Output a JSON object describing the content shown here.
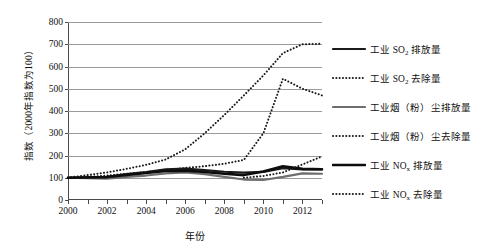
{
  "chart_data": {
    "type": "line",
    "title": "",
    "xlabel": "年份",
    "ylabel": "指数（2000年指数为100）",
    "x": [
      2000,
      2001,
      2002,
      2003,
      2004,
      2005,
      2006,
      2007,
      2008,
      2009,
      2010,
      2011,
      2012,
      2013
    ],
    "xlim": [
      2000,
      2013
    ],
    "ylim": [
      0,
      800
    ],
    "yticks": [
      0,
      100,
      200,
      300,
      400,
      500,
      600,
      700,
      800
    ],
    "xticks_labeled": [
      2000,
      2002,
      2004,
      2006,
      2008,
      2010,
      2012
    ],
    "grid": "horizontal",
    "legend_position": "right",
    "series": [
      {
        "name": "工业 SO₂ 排放量",
        "name_base": "工业 SO",
        "name_sub": "2",
        "name_tail": " 排放量",
        "style": "solid",
        "color": "#1a1a1a",
        "width": 2.2,
        "values": [
          100,
          102,
          104,
          116,
          126,
          138,
          141,
          134,
          127,
          123,
          126,
          143,
          138,
          137
        ]
      },
      {
        "name": "工业 SO₂ 去除量",
        "name_base": "工业 SO",
        "name_sub": "2",
        "name_tail": " 去除量",
        "style": "dotted",
        "color": "#1a1a1a",
        "width": 2.0,
        "values": [
          100,
          112,
          124,
          140,
          158,
          182,
          228,
          300,
          382,
          470,
          560,
          660,
          700,
          702
        ]
      },
      {
        "name": "工业烟（粉）尘排放量",
        "name_base": "工业烟（粉）尘排放量",
        "name_sub": "",
        "name_tail": "",
        "style": "solid",
        "color": "#6e6e6e",
        "width": 2.2,
        "values": [
          100,
          98,
          96,
          104,
          110,
          120,
          124,
          116,
          104,
          92,
          90,
          104,
          120,
          118
        ]
      },
      {
        "name": "工业烟（粉）尘去除量",
        "name_base": "工业烟（粉）尘去除量",
        "name_sub": "",
        "name_tail": "",
        "style": "dotted",
        "color": "#1a1a1a",
        "width": 2.0,
        "values": [
          100,
          104,
          110,
          118,
          126,
          134,
          144,
          152,
          163,
          180,
          300,
          545,
          500,
          470
        ]
      },
      {
        "name": "工业 NOₓ 排放量",
        "name_base": "工业 NO",
        "name_sub": "x",
        "name_tail": " 排放量",
        "style": "solid",
        "color": "#0d0d0d",
        "width": 2.6,
        "values": [
          100,
          101,
          103,
          112,
          121,
          130,
          132,
          126,
          118,
          112,
          128,
          152,
          140,
          138
        ]
      },
      {
        "name": "工业 NOₓ 去除量",
        "name_base": "工业 NO",
        "name_sub": "x",
        "name_tail": " 去除量",
        "style": "dotted",
        "color": "#1a1a1a",
        "width": 2.0,
        "values": [
          null,
          null,
          null,
          null,
          null,
          null,
          null,
          null,
          null,
          100,
          108,
          124,
          160,
          196
        ]
      }
    ]
  }
}
